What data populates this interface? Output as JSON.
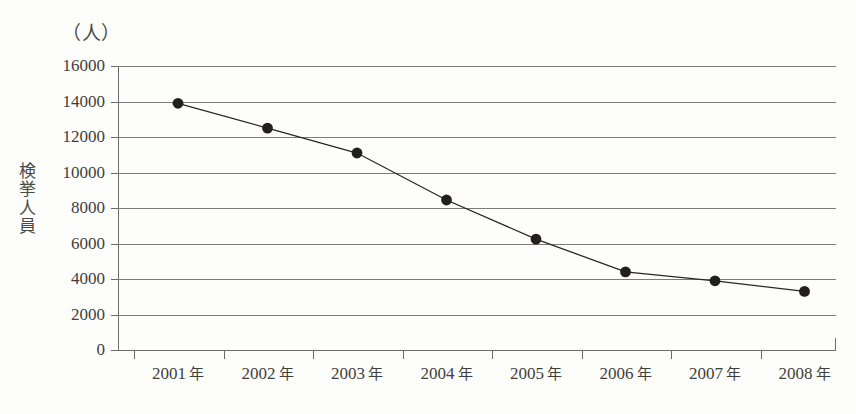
{
  "chart_data": {
    "type": "line",
    "title": "",
    "subtitle": "",
    "unit_label": "（人）",
    "xlabel": "",
    "ylabel": "検挙人員",
    "ylabel_chars": [
      "検",
      "挙",
      "人",
      "員"
    ],
    "categories": [
      "2001 年",
      "2002 年",
      "2003 年",
      "2004 年",
      "2005 年",
      "2006 年",
      "2007 年",
      "2008 年"
    ],
    "x_values": [
      2001,
      2002,
      2003,
      2004,
      2005,
      2006,
      2007,
      2008
    ],
    "values": [
      13900,
      12500,
      11100,
      8450,
      6250,
      4400,
      3900,
      3300
    ],
    "ylim": [
      0,
      16000
    ],
    "y_ticks": [
      0,
      2000,
      4000,
      6000,
      8000,
      10000,
      12000,
      14000,
      16000
    ],
    "y_tick_labels": [
      "0",
      "2000",
      "4000",
      "6000",
      "8000",
      "10000",
      "12000",
      "14000",
      "16000"
    ],
    "grid": true,
    "grid_axis": "y",
    "legend": null,
    "legend_position": "none",
    "marker": "filled-circle",
    "marker_color": "#231f1c",
    "line_color": "#2a2724",
    "grid_color": "#7d7d78",
    "axis_color": "#6b6b66",
    "background_color": "#fdfdfb",
    "annotations": []
  }
}
